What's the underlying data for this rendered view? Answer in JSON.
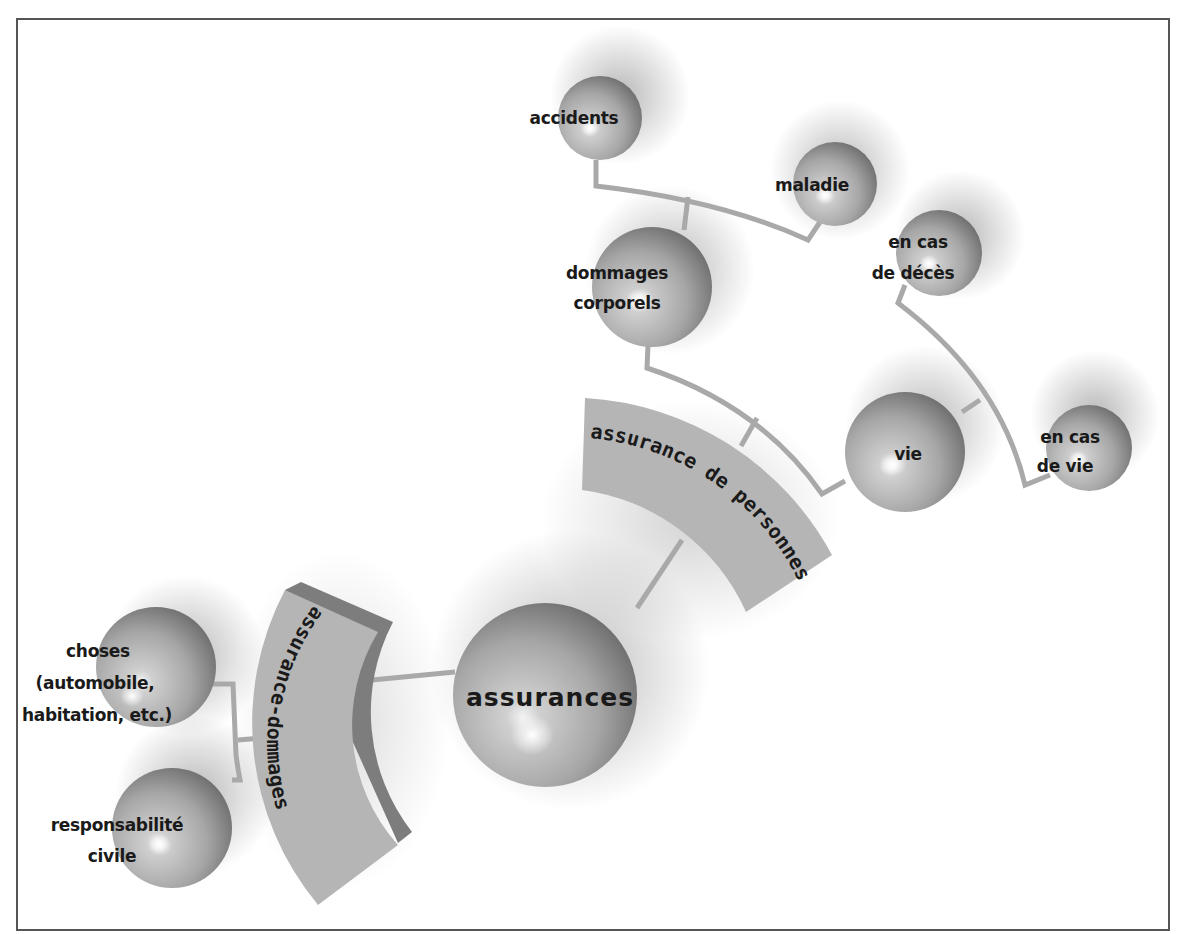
{
  "diagram": {
    "root": {
      "label": "assurances"
    },
    "branches": [
      {
        "label": "assurance de personnes",
        "children": [
          {
            "label_lines": [
              "dommages",
              "corporels"
            ],
            "children": [
              {
                "label_lines": [
                  "accidents"
                ]
              },
              {
                "label_lines": [
                  "maladie"
                ]
              }
            ]
          },
          {
            "label_lines": [
              "vie"
            ],
            "children": [
              {
                "label_lines": [
                  "en cas",
                  "de décès"
                ]
              },
              {
                "label_lines": [
                  "en cas",
                  "de vie"
                ]
              }
            ]
          }
        ]
      },
      {
        "label": "assurance-dommages",
        "children": [
          {
            "label_lines": [
              "choses",
              "(automobile,",
              "habitation, etc.)"
            ]
          },
          {
            "label_lines": [
              "responsabilité",
              "civile"
            ]
          }
        ]
      }
    ]
  },
  "colors": {
    "sphere_light": "#d6d6d6",
    "sphere_dark": "#6e6e6e",
    "arc_fill": "#b5b5b5",
    "arc_edge": "#7d7d7d",
    "connector": "#a9a9a9",
    "border": "#555555"
  }
}
